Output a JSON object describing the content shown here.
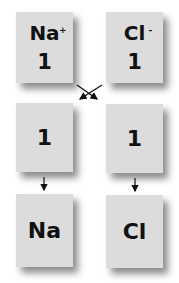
{
  "top_row": [
    {
      "symbol": "Na",
      "charge": "+",
      "value": "1"
    },
    {
      "symbol": "Cl",
      "charge": "-",
      "value": "1"
    }
  ],
  "middle_row": [
    {
      "value": "1"
    },
    {
      "value": "1"
    }
  ],
  "bottom_row": [
    {
      "symbol": "Na"
    },
    {
      "symbol": "Cl"
    }
  ],
  "colors": {
    "box_fill": "#dcdcdc",
    "arrow": "#111111",
    "background": "#ffffff"
  }
}
